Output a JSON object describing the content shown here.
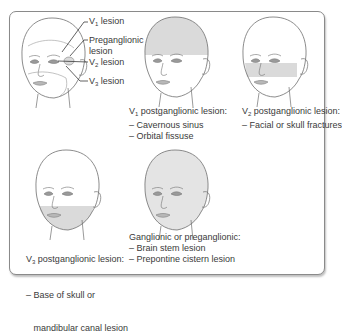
{
  "colors": {
    "shade": "#dadada",
    "line": "#6e6e6e",
    "border": "#8a8a8a",
    "text": "#3a3a3a"
  },
  "panel1": {
    "labels": {
      "v1": {
        "prefix": "V",
        "sub": "1",
        "text": " lesion"
      },
      "pregang_line1": "Preganglionic",
      "pregang_line2": "lesion",
      "v2": {
        "prefix": "V",
        "sub": "2",
        "text": " lesion"
      },
      "v3": {
        "prefix": "V",
        "sub": "3",
        "text": " lesion"
      }
    }
  },
  "panel2": {
    "title": {
      "prefix": "V",
      "sub": "1",
      "text": " postganglionic lesion:"
    },
    "items": [
      "– Cavernous sinus",
      "– Orbital fissuse"
    ]
  },
  "panel3": {
    "title": {
      "prefix": "V",
      "sub": "2",
      "text": " postganglionic lesion:"
    },
    "items": [
      "– Facial or skull fractures"
    ]
  },
  "panel4": {
    "title": {
      "prefix": "V",
      "sub": "3",
      "text": " postganglionic lesion:"
    },
    "items": [
      "– Base of skull or",
      "   mandibular canal lesion"
    ]
  },
  "panel5": {
    "title": "Ganglionic or preganglionic:",
    "items": [
      "– Brain stem lesion",
      "– Prepontine cistern lesion"
    ]
  }
}
